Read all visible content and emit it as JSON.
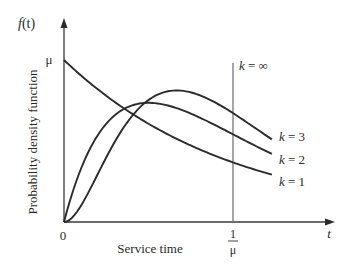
{
  "chart_data": {
    "type": "line",
    "title": "",
    "xlabel": "Service time",
    "ylabel": "Probability density function",
    "x_axis_symbol": "t",
    "y_axis_symbol": "f(t)",
    "x_ticks": [
      {
        "value": 0,
        "label": "0"
      },
      {
        "value": 1,
        "label_num": "1",
        "label_den": "μ"
      }
    ],
    "y_ticks": [
      {
        "value": 1,
        "label": "μ"
      }
    ],
    "xlim": [
      0,
      1.6
    ],
    "ylim": [
      0,
      1.2
    ],
    "grid": false,
    "legend": "inline labels at right end of curves",
    "annotations": [
      {
        "text": "k = ∞",
        "at_x": 1,
        "note": "vertical line at t = 1/μ"
      }
    ],
    "series": [
      {
        "name": "k = 1",
        "k": 1,
        "x": [
          0,
          0.1,
          0.2,
          0.3,
          0.4,
          0.5,
          0.6,
          0.7,
          0.8,
          0.9,
          1.0,
          1.1,
          1.2
        ],
        "values": [
          1.0,
          0.905,
          0.819,
          0.741,
          0.67,
          0.607,
          0.549,
          0.497,
          0.449,
          0.407,
          0.368,
          0.333,
          0.301
        ]
      },
      {
        "name": "k = 2",
        "k": 2,
        "x": [
          0,
          0.1,
          0.2,
          0.3,
          0.4,
          0.5,
          0.6,
          0.7,
          0.8,
          0.9,
          1.0,
          1.1,
          1.2
        ],
        "values": [
          0.0,
          0.327,
          0.536,
          0.659,
          0.719,
          0.736,
          0.723,
          0.69,
          0.646,
          0.595,
          0.541,
          0.488,
          0.435
        ]
      },
      {
        "name": "k = 3",
        "k": 3,
        "x": [
          0,
          0.1,
          0.2,
          0.3,
          0.4,
          0.5,
          0.6,
          0.7,
          0.8,
          0.9,
          1.0,
          1.1,
          1.2
        ],
        "values": [
          0.0,
          0.1,
          0.296,
          0.493,
          0.651,
          0.753,
          0.8,
          0.806,
          0.779,
          0.732,
          0.672,
          0.601,
          0.533
        ]
      }
    ],
    "labels": {
      "k1": "k = 1",
      "k2": "k = 2",
      "k3": "k = 3",
      "kinf": "k = ∞",
      "origin": "0",
      "mu": "μ",
      "one": "1",
      "t": "t",
      "f": "f",
      "paren_t": "(t)"
    }
  }
}
